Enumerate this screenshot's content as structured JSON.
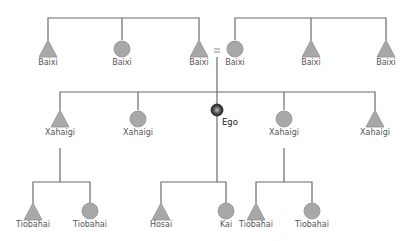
{
  "diagram": {
    "type": "kinship-chart",
    "colors": {
      "line": "#6b6b6b",
      "symbol_fill": "#a8a8a8",
      "symbol_stroke": "#8a8a8a",
      "ego": "#333333",
      "label": "#555555"
    },
    "generation_plus1": {
      "left_sibling_group": [
        {
          "label": "Baixi",
          "sex": "male"
        },
        {
          "label": "Baixi",
          "sex": "female"
        },
        {
          "label": "Baixi",
          "sex": "male"
        }
      ],
      "marriage_symbol": "=",
      "right_sibling_group": [
        {
          "label": "Baixi",
          "sex": "female"
        },
        {
          "label": "Baixi",
          "sex": "male"
        },
        {
          "label": "Baixi",
          "sex": "male"
        }
      ]
    },
    "generation_0": [
      {
        "label": "Xahaigi",
        "sex": "male"
      },
      {
        "label": "Xahaigi",
        "sex": "female"
      },
      {
        "label": "Ego",
        "sex": "ego"
      },
      {
        "label": "Xahaigi",
        "sex": "female"
      },
      {
        "label": "Xahaigi",
        "sex": "male"
      }
    ],
    "generation_minus1": {
      "left_family": [
        {
          "label": "Tiobahai",
          "sex": "male"
        },
        {
          "label": "Tiobahai",
          "sex": "female"
        }
      ],
      "ego_family": [
        {
          "label": "Hosai",
          "sex": "male"
        },
        {
          "label": "Kai",
          "sex": "female"
        }
      ],
      "right_family": [
        {
          "label": "Tiobahai",
          "sex": "male"
        },
        {
          "label": "Tiobahai",
          "sex": "female"
        }
      ]
    }
  }
}
